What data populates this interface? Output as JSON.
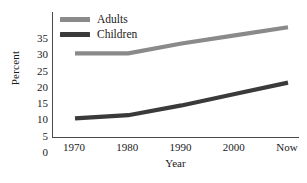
{
  "chart_data": {
    "type": "line",
    "title": "",
    "xlabel": "Year",
    "ylabel": "Percent",
    "categories": [
      "1970",
      "1980",
      "1990",
      "2000",
      "Now"
    ],
    "series": [
      {
        "name": "Adults",
        "values": [
          26,
          26,
          29,
          31.5,
          34
        ],
        "color": "#8a8a8a"
      },
      {
        "name": "Children",
        "values": [
          6,
          7,
          10,
          13.5,
          17
        ],
        "color": "#3a3a3a"
      }
    ],
    "ylim": [
      0,
      35
    ],
    "yticks": [
      0,
      5,
      10,
      15,
      20,
      25,
      30,
      35
    ],
    "ytick_labels": [
      "0",
      "5",
      "10",
      "15",
      "20",
      "25",
      "30",
      "35"
    ],
    "grid": false,
    "legend_position": "top-left-inside"
  },
  "axes": {
    "y_title": "Percent",
    "x_title": "Year"
  },
  "legend": {
    "entries": [
      {
        "label": "Adults",
        "swatch_color": "#8a8a8a"
      },
      {
        "label": "Children",
        "swatch_color": "#3a3a3a"
      }
    ]
  },
  "colors": {
    "adults_line": "#8a8a8a",
    "children_line": "#3a3a3a",
    "axis": "#4a4a4a",
    "text": "#1a1a1a",
    "background": "#ffffff"
  }
}
